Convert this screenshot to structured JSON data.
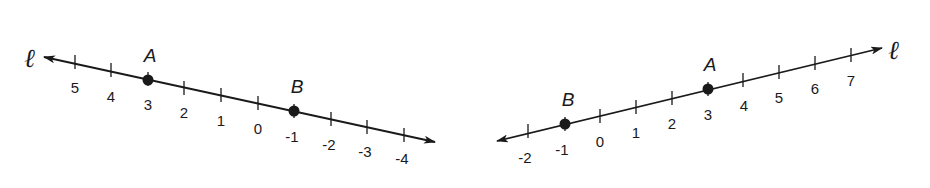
{
  "figures": [
    {
      "id": "left",
      "line_label": "ℓ",
      "direction": "decreasing-left-to-right",
      "ticks": [
        "5",
        "4",
        "3",
        "2",
        "1",
        "0",
        "-1",
        "-2",
        "-3",
        "-4"
      ],
      "points": [
        {
          "name": "A",
          "value": 3
        },
        {
          "name": "B",
          "value": -1
        }
      ]
    },
    {
      "id": "right",
      "line_label": "ℓ",
      "direction": "increasing-left-to-right",
      "ticks": [
        "-2",
        "-1",
        "0",
        "1",
        "2",
        "3",
        "4",
        "5",
        "6",
        "7"
      ],
      "points": [
        {
          "name": "B",
          "value": -1
        },
        {
          "name": "A",
          "value": 3
        }
      ]
    }
  ],
  "colors": {
    "ink": "#1a1a1a",
    "background": "#ffffff"
  }
}
